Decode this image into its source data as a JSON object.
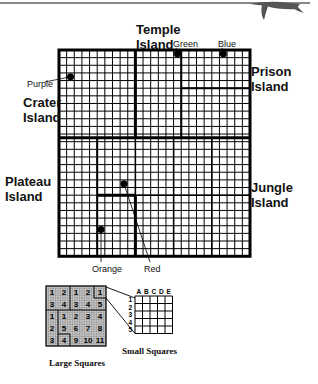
{
  "map": {
    "grid": {
      "cols": 25,
      "rows": 27,
      "cell_px": 7.64
    },
    "islands": [
      {
        "id": "temple",
        "label_line1": "Temple",
        "label_line2": "Island"
      },
      {
        "id": "crater",
        "label_line1": "Crater",
        "label_line2": "Island"
      },
      {
        "id": "prison",
        "label_line1": "Prison",
        "label_line2": "Island"
      },
      {
        "id": "plateau",
        "label_line1": "Plateau",
        "label_line2": "Island"
      },
      {
        "id": "jungle",
        "label_line1": "Jungle",
        "label_line2": "Island"
      }
    ],
    "markers": [
      {
        "name": "Purple",
        "col": 1,
        "row": 3
      },
      {
        "name": "Green",
        "col": 15,
        "row": 0
      },
      {
        "name": "Blue",
        "col": 21,
        "row": 0
      },
      {
        "name": "Red",
        "col": 8,
        "row": 17
      },
      {
        "name": "Orange",
        "col": 5,
        "row": 23
      }
    ]
  },
  "legend": {
    "large_squares_caption": "Large Squares",
    "small_squares_caption": "Small Squares",
    "large_square_numbers": [
      [
        "1",
        "2",
        "1",
        "2",
        "1"
      ],
      [
        "3",
        "4",
        "3",
        "4",
        "5"
      ],
      [
        "1",
        "1",
        "2",
        "3",
        "4"
      ],
      [
        "2",
        "5",
        "6",
        "7",
        "8"
      ],
      [
        "3",
        "4",
        "9",
        "10",
        "11"
      ]
    ],
    "small_cols": [
      "A",
      "B",
      "C",
      "D",
      "E"
    ],
    "small_rows": [
      "1",
      "2",
      "3",
      "4",
      "5"
    ]
  }
}
